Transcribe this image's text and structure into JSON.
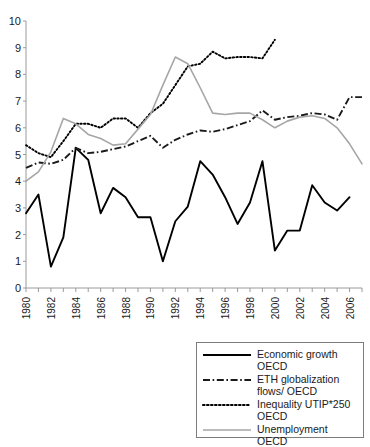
{
  "chart_data": {
    "type": "line",
    "title": "",
    "xlabel": "",
    "ylabel": "",
    "xlim": [
      1980,
      2007
    ],
    "ylim": [
      0,
      10
    ],
    "ytick_step": 1,
    "xtick_step": 1,
    "grid": false,
    "legend_position": "bottom-right",
    "x": [
      1980,
      1981,
      1982,
      1983,
      1984,
      1985,
      1986,
      1987,
      1988,
      1989,
      1990,
      1991,
      1992,
      1993,
      1994,
      1995,
      1996,
      1997,
      1998,
      1999,
      2000,
      2001,
      2002,
      2003,
      2004,
      2005,
      2006,
      2007
    ],
    "yticks": [
      "0",
      "1",
      "2",
      "3",
      "4",
      "5",
      "6",
      "7",
      "8",
      "9",
      "10"
    ],
    "xticks": [
      "1980",
      "1982",
      "1984",
      "1986",
      "1988",
      "1990",
      "1992",
      "1994",
      "1996",
      "1998",
      "2000",
      "2002",
      "2004",
      "2006"
    ],
    "series": [
      {
        "name": "Economic growth OECD",
        "style": "solid",
        "color": "#000000",
        "values": [
          2.8,
          3.5,
          0.8,
          1.9,
          5.25,
          4.8,
          2.8,
          3.75,
          3.4,
          2.65,
          2.65,
          1.0,
          2.5,
          3.05,
          4.75,
          4.25,
          3.4,
          2.4,
          3.2,
          4.75,
          1.4,
          2.15,
          2.15,
          3.85,
          3.2,
          2.9,
          3.4,
          null
        ]
      },
      {
        "name": "ETH globalization flows/ OECD",
        "style": "dash-dot",
        "color": "#1a1a1a",
        "values": [
          4.5,
          4.7,
          4.65,
          4.8,
          5.25,
          5.05,
          5.1,
          5.2,
          5.3,
          5.5,
          5.7,
          5.25,
          5.55,
          5.75,
          5.9,
          5.85,
          5.95,
          6.1,
          6.25,
          6.65,
          6.3,
          6.4,
          6.45,
          6.55,
          6.5,
          6.3,
          7.15,
          7.15
        ]
      },
      {
        "name": "Inequality UTIP*250 OECD",
        "style": "dotted",
        "color": "#000000",
        "values": [
          5.35,
          5.05,
          4.9,
          5.5,
          6.15,
          6.15,
          6.0,
          6.35,
          6.35,
          6.0,
          6.55,
          6.9,
          7.6,
          8.3,
          8.4,
          8.85,
          8.6,
          8.65,
          8.65,
          8.6,
          9.3,
          null,
          null,
          null,
          null,
          null,
          null,
          null
        ]
      },
      {
        "name": "Unemployment OECD",
        "style": "solid",
        "color": "#a6a6a6",
        "values": [
          4.0,
          4.35,
          5.1,
          6.35,
          6.15,
          5.75,
          5.6,
          5.35,
          5.4,
          5.95,
          6.5,
          7.6,
          8.65,
          8.4,
          7.5,
          6.55,
          6.5,
          6.55,
          6.55,
          6.3,
          6.0,
          6.25,
          6.4,
          6.45,
          6.35,
          6.0,
          5.4,
          4.65
        ]
      }
    ]
  },
  "legend": {
    "items": [
      {
        "label": "Economic growth OECD",
        "style": "solid",
        "color": "#000000"
      },
      {
        "label": "ETH globalization flows/ OECD",
        "style": "dash-dot",
        "color": "#1a1a1a"
      },
      {
        "label": "Inequality UTIP*250 OECD",
        "style": "dotted",
        "color": "#000000"
      },
      {
        "label": "Unemployment OECD",
        "style": "solid",
        "color": "#a6a6a6"
      }
    ]
  }
}
